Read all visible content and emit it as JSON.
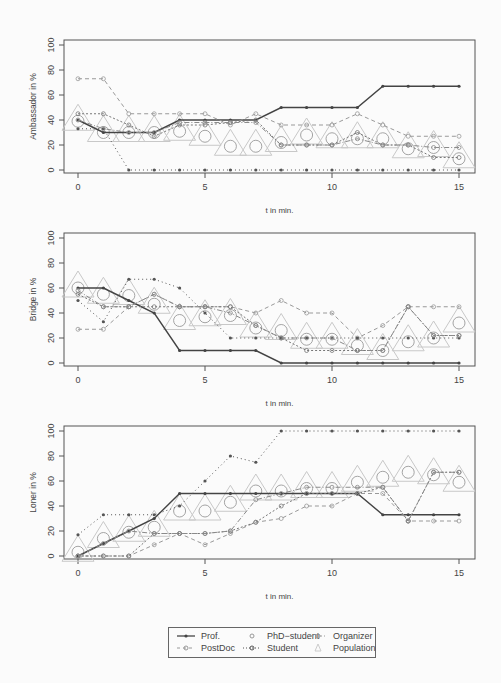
{
  "chart_data": [
    {
      "type": "line",
      "title": "",
      "xlabel": "t in min.",
      "ylabel": "Ambassador  in %",
      "xlim": [
        0,
        15
      ],
      "ylim": [
        0,
        100
      ],
      "x_ticks": [
        0,
        5,
        10,
        15
      ],
      "y_ticks": [
        0,
        20,
        40,
        60,
        80,
        100
      ],
      "x": [
        0,
        1,
        2,
        3,
        4,
        5,
        6,
        7,
        8,
        9,
        10,
        11,
        12,
        13,
        14,
        15
      ],
      "series": [
        {
          "name": "Prof.",
          "values": [
            40,
            30,
            30,
            30,
            40,
            40,
            40,
            40,
            50,
            50,
            50,
            50,
            67,
            67,
            67,
            67
          ]
        },
        {
          "name": "PostDoc",
          "values": [
            73,
            73,
            45,
            45,
            45,
            45,
            36,
            45,
            36,
            36,
            36,
            45,
            36,
            27,
            27,
            27
          ]
        },
        {
          "name": "PhD-student",
          "values": [
            45,
            45,
            36,
            27,
            36,
            36,
            38,
            40,
            20,
            20,
            20,
            30,
            20,
            20,
            10,
            10
          ]
        },
        {
          "name": "Student",
          "values": [
            33,
            33,
            0,
            0,
            0,
            0,
            0,
            0,
            0,
            0,
            0,
            0,
            0,
            0,
            0,
            0
          ]
        },
        {
          "name": "Organizer",
          "values": [
            40,
            33,
            30,
            30,
            38,
            38,
            38,
            38,
            20,
            20,
            20,
            25,
            20,
            20,
            18,
            18
          ]
        },
        {
          "name": "Population",
          "values": [
            39,
            30,
            30,
            30,
            31,
            27,
            19,
            19,
            22,
            28,
            25,
            25,
            25,
            17,
            18,
            9
          ]
        }
      ]
    },
    {
      "type": "line",
      "title": "",
      "xlabel": "t in min.",
      "ylabel": "Bridge  in %",
      "xlim": [
        0,
        15
      ],
      "ylim": [
        0,
        100
      ],
      "x_ticks": [
        0,
        5,
        10,
        15
      ],
      "y_ticks": [
        0,
        20,
        40,
        60,
        80,
        100
      ],
      "x": [
        0,
        1,
        2,
        3,
        4,
        5,
        6,
        7,
        8,
        9,
        10,
        11,
        12,
        13,
        14,
        15
      ],
      "series": [
        {
          "name": "Prof.",
          "values": [
            60,
            60,
            50,
            40,
            10,
            10,
            10,
            10,
            0,
            0,
            0,
            0,
            0,
            0,
            0,
            0
          ]
        },
        {
          "name": "PostDoc",
          "values": [
            27,
            27,
            45,
            55,
            45,
            45,
            45,
            40,
            50,
            40,
            40,
            20,
            30,
            45,
            45,
            45
          ]
        },
        {
          "name": "PhD-student",
          "values": [
            55,
            45,
            45,
            45,
            45,
            45,
            45,
            30,
            20,
            10,
            10,
            10,
            10,
            45,
            22,
            22
          ]
        },
        {
          "name": "Student",
          "values": [
            50,
            33,
            67,
            67,
            60,
            40,
            20,
            20,
            20,
            20,
            20,
            20,
            20,
            20,
            20,
            20
          ]
        },
        {
          "name": "Organizer",
          "values": [
            58,
            45,
            45,
            55,
            45,
            45,
            40,
            30,
            20,
            20,
            20,
            10,
            10,
            45,
            22,
            22
          ]
        },
        {
          "name": "Population",
          "values": [
            60,
            55,
            54,
            47,
            34,
            37,
            38,
            28,
            26,
            19,
            19,
            14,
            10,
            17,
            20,
            32
          ]
        }
      ]
    },
    {
      "type": "line",
      "title": "",
      "xlabel": "t in min.",
      "ylabel": "Loner  in %",
      "xlim": [
        0,
        15
      ],
      "ylim": [
        0,
        100
      ],
      "x_ticks": [
        0,
        5,
        10,
        15
      ],
      "y_ticks": [
        0,
        20,
        40,
        60,
        80,
        100
      ],
      "x": [
        0,
        1,
        2,
        3,
        4,
        5,
        6,
        7,
        8,
        9,
        10,
        11,
        12,
        13,
        14,
        15
      ],
      "series": [
        {
          "name": "Prof.",
          "values": [
            0,
            10,
            20,
            30,
            50,
            50,
            50,
            50,
            50,
            50,
            50,
            50,
            33,
            33,
            33,
            33
          ]
        },
        {
          "name": "PostDoc",
          "values": [
            0,
            0,
            0,
            9,
            18,
            9,
            18,
            27,
            30,
            40,
            40,
            50,
            50,
            28,
            28,
            28
          ]
        },
        {
          "name": "PhD-student",
          "values": [
            0,
            0,
            0,
            18,
            18,
            18,
            20,
            27,
            40,
            50,
            50,
            50,
            55,
            28,
            67,
            67
          ]
        },
        {
          "name": "Student",
          "values": [
            17,
            33,
            33,
            33,
            40,
            60,
            80,
            75,
            100,
            100,
            100,
            100,
            100,
            100,
            100,
            100
          ]
        },
        {
          "name": "Organizer",
          "values": [
            0,
            10,
            20,
            18,
            18,
            18,
            20,
            45,
            50,
            55,
            55,
            55,
            55,
            28,
            67,
            67
          ]
        },
        {
          "name": "Population",
          "values": [
            3,
            14,
            19,
            23,
            36,
            36,
            43,
            52,
            52,
            54,
            54,
            59,
            63,
            67,
            65,
            59
          ]
        }
      ]
    }
  ],
  "legend": {
    "items": [
      {
        "label": "Prof.",
        "style": "solid-dark"
      },
      {
        "label": "PhD−student",
        "style": "circle-only"
      },
      {
        "label": "Organizer",
        "style": "dashdot-grey"
      },
      {
        "label": "PostDoc",
        "style": "dashed-grey"
      },
      {
        "label": "Student",
        "style": "dotted-dark"
      },
      {
        "label": "Population",
        "style": "triangle-light"
      }
    ]
  },
  "colors": {
    "prof": "#444444",
    "postdoc": "#999999",
    "phd": "#777777",
    "student": "#555555",
    "organizer": "#8a8a8a",
    "population": "#c8c8c8",
    "axis": "#555555"
  }
}
